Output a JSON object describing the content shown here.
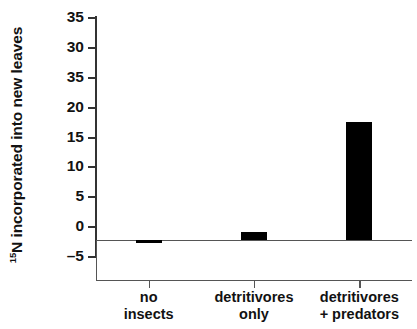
{
  "chart_data": {
    "type": "bar",
    "title": "",
    "subtitle": "",
    "xlabel": "",
    "ylabel": "15N incorporated into new leaves",
    "ylabel_superscript": "15",
    "ylabel_rest": "N incorporated into new leaves",
    "categories": [
      "no insects",
      "detritivores only",
      "detritivores + predators"
    ],
    "category_lines": [
      [
        "no",
        "insects"
      ],
      [
        "detritivores",
        "only"
      ],
      [
        "detritivores",
        "+ predators"
      ]
    ],
    "values": [
      -0.3,
      1.4,
      19.7
    ],
    "ylim": [
      -5,
      35
    ],
    "yticks": [
      35,
      30,
      35,
      20,
      15,
      10,
      5,
      0,
      -5
    ],
    "ytick_labels": [
      "35",
      "30",
      "35",
      "20",
      "15",
      "10",
      "5",
      "0",
      "-5"
    ],
    "grid": false,
    "legend": "none",
    "bar_color": "#000000",
    "axis_color": "#333333",
    "zero_line": 0
  }
}
